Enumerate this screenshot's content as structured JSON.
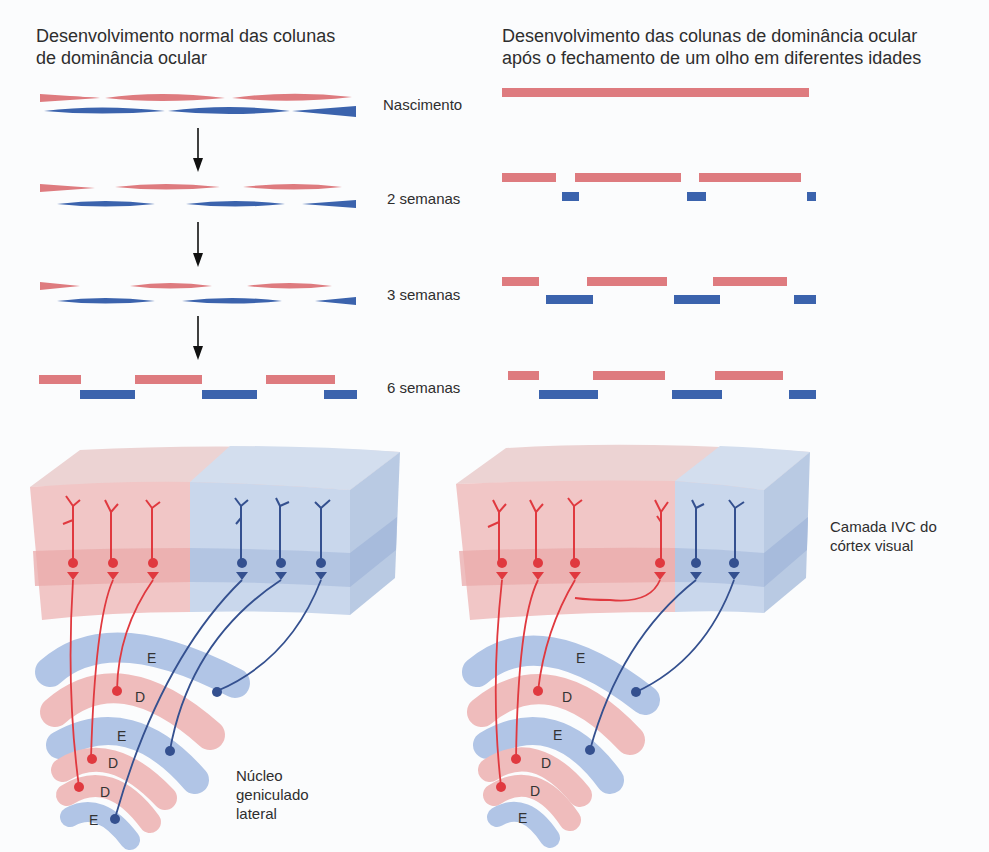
{
  "left_panel": {
    "title_line1": "Desenvolvimento normal das colunas",
    "title_line2": "de dominância ocular"
  },
  "right_panel": {
    "title_line1": "Desenvolvimento das colunas de dominância ocular",
    "title_line2": "após o fechamento de um olho em diferentes idades"
  },
  "stages": [
    {
      "label": "Nascimento"
    },
    {
      "label": "2 semanas"
    },
    {
      "label": "3 semanas"
    },
    {
      "label": "6 semanas"
    }
  ],
  "labels": {
    "cortex_line1": "Camada IVC do",
    "cortex_line2": "córtex visual",
    "lgn_line1": "Núcleo",
    "lgn_line2": "geniculado",
    "lgn_line3": "lateral"
  },
  "lgn_layers_left": [
    "E",
    "D",
    "E",
    "D",
    "D",
    "E"
  ],
  "lgn_layers_right": [
    "E",
    "D",
    "E",
    "D",
    "D",
    "E"
  ],
  "colors": {
    "right_eye_red": "#de7b7f",
    "left_eye_blue": "#3b63ad",
    "red_neuron": "#e0393f",
    "blue_neuron": "#34508f",
    "cortex_red": "#f1c6c6",
    "cortex_blue": "#c9d7ec"
  }
}
